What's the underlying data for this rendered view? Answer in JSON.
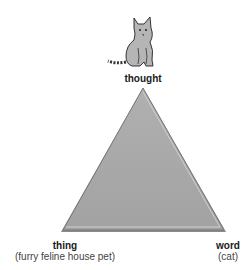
{
  "diagram": {
    "type": "semiotic-triangle",
    "vertices": {
      "top": {
        "label": "thought"
      },
      "left": {
        "label": "thing",
        "sublabel": "(furry feline house pet)"
      },
      "right": {
        "label": "word",
        "sublabel": "(cat)"
      }
    },
    "icon": "cat-icon",
    "colors": {
      "triangle_fill": "#a8a8a8",
      "triangle_edge": "#7a7a7a",
      "text": "#1a1a1a"
    }
  }
}
